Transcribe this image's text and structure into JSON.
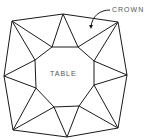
{
  "diagram": {
    "labels": {
      "table": "TABLE",
      "crown": "CROWN"
    },
    "colors": {
      "line": "#1a1a1a",
      "text": "#555555",
      "background": "#ffffff"
    },
    "outer_vertices": [
      [
        12,
        21
      ],
      [
        63,
        14
      ],
      [
        118,
        22
      ],
      [
        127,
        75
      ],
      [
        118,
        128
      ],
      [
        67,
        137
      ],
      [
        13,
        130
      ],
      [
        4,
        76
      ]
    ],
    "table_vertices": [
      [
        52,
        47
      ],
      [
        78,
        47
      ],
      [
        94,
        61
      ],
      [
        94,
        85
      ],
      [
        79,
        106
      ],
      [
        54,
        107
      ],
      [
        36,
        88
      ],
      [
        35,
        60
      ]
    ]
  }
}
